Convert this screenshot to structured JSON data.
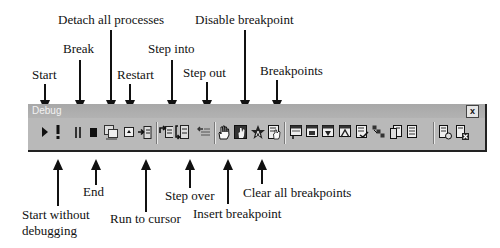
{
  "figure": {
    "top_labels": {
      "detach_all_processes": "Detach all processes",
      "disable_breakpoint": "Disable breakpoint",
      "break": "Break",
      "step_into": "Step into",
      "start": "Start",
      "restart": "Restart",
      "step_out": "Step out",
      "breakpoints": "Breakpoints"
    },
    "bottom_labels": {
      "end": "End",
      "step_over": "Step over",
      "clear_all_breakpoints": "Clear all breakpoints",
      "start_without_debugging_line1": "Start without",
      "start_without_debugging_line2": "debugging",
      "run_to_cursor": "Run to cursor",
      "insert_breakpoint": "Insert breakpoint"
    }
  },
  "toolbar": {
    "title": "Debug",
    "close_label": "x",
    "groups": [
      {
        "name": "execution",
        "buttons": [
          "Start",
          "Start without debugging",
          "Break",
          "End",
          "Detach all processes",
          "Restart",
          "Run to cursor"
        ]
      },
      {
        "name": "stepping",
        "buttons": [
          "Step into",
          "Step over",
          "Step out"
        ]
      },
      {
        "name": "breakpoints",
        "buttons": [
          "Insert breakpoint",
          "Disable breakpoint",
          "Clear all breakpoints",
          "Breakpoints"
        ]
      },
      {
        "name": "debug-windows",
        "buttons": [
          "Watch 1",
          "Watch 2",
          "Locals",
          "Autos",
          "Immediate",
          "Call stack",
          "Memory",
          "Registers"
        ]
      },
      {
        "name": "other",
        "buttons": [
          "Disassembly",
          "Clear"
        ]
      }
    ]
  }
}
